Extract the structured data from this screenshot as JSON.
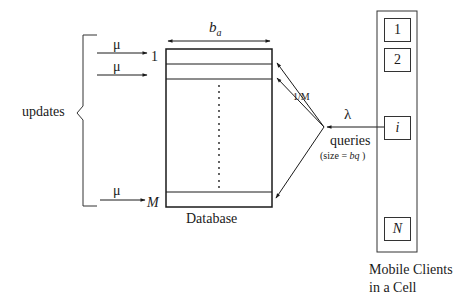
{
  "diagram": {
    "updates_label": "updates",
    "update_rate_1": "μ",
    "update_rate_2": "μ",
    "update_rate_m": "μ",
    "row_first_label": "1",
    "row_last_label": "M",
    "bucket_size_label": "b",
    "bucket_size_sub": "a",
    "database_label": "Database",
    "query_prob_label": "1/M",
    "query_rate_label": "λ",
    "queries_label": "queries",
    "query_size_label_prefix": "(size = ",
    "query_size_var": "bq",
    "query_size_label_suffix": " )",
    "clients": [
      {
        "label": "1"
      },
      {
        "label": "2"
      },
      {
        "label": "i"
      },
      {
        "label": "N"
      }
    ],
    "clients_caption_line1": "Mobile Clients",
    "clients_caption_line2": "in a Cell",
    "vertical_dots": "⋮"
  }
}
